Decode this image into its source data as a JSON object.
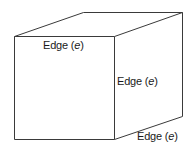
{
  "diagram": {
    "type": "cube",
    "labels": {
      "top_edge": {
        "word": "Edge",
        "open": " (",
        "var": "e",
        "close": ")"
      },
      "side_edge": {
        "word": "Edge",
        "open": " (",
        "var": "e",
        "close": ")"
      },
      "depth_edge": {
        "word": "Edge",
        "open": " (",
        "var": "e",
        "close": ")"
      }
    },
    "stroke_color": "#333333"
  }
}
